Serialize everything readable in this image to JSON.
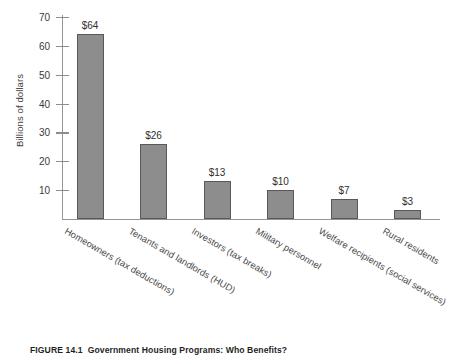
{
  "chart_data": {
    "type": "bar",
    "title": "",
    "xlabel": "",
    "ylabel": "Billions of dollars",
    "ylim": [
      0,
      73
    ],
    "yticks": [
      10,
      20,
      30,
      40,
      50,
      60,
      70
    ],
    "ytick_labels": [
      "10",
      "20",
      "30",
      "40",
      "50",
      "60",
      "70"
    ],
    "grid": false,
    "legend": "none",
    "bar_color": "#8d8d8d",
    "bar_edge_color": "#585858",
    "axis_color": "#949494",
    "categories": [
      "Homeowners (tax deductions)",
      "Tenants and landlords (HUD)",
      "Investors (tax breaks)",
      "Military personnel",
      "Welfare recipients (social services)",
      "Rural residents"
    ],
    "values": [
      64,
      26,
      13,
      10,
      7,
      3
    ],
    "data_labels": [
      "$64",
      "$26",
      "$13",
      "$10",
      "$7",
      "$3"
    ]
  },
  "caption": {
    "figure_number": "FIGURE 14.1",
    "figure_title": "Government Housing Programs: Who Benefits?"
  }
}
